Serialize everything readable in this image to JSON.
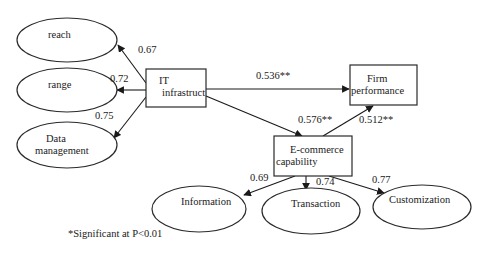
{
  "diagram": {
    "type": "structural-equation-model",
    "nodes": {
      "reach": {
        "label": "reach",
        "shape": "ellipse"
      },
      "range": {
        "label": "range",
        "shape": "ellipse"
      },
      "data_management": {
        "label_line1": "Data",
        "label_line2": "management",
        "shape": "ellipse"
      },
      "it_infrastructure": {
        "label_line1": "IT",
        "label_line2": "infrastruct",
        "shape": "rectangle"
      },
      "firm_performance": {
        "label_line1": "Firm",
        "label_line2": "performance",
        "shape": "rectangle"
      },
      "ecommerce_capability": {
        "label_line1": "E-commerce",
        "label_line2": "capability",
        "shape": "rectangle"
      },
      "information": {
        "label": "Information",
        "shape": "ellipse"
      },
      "transaction": {
        "label": "Transaction",
        "shape": "ellipse"
      },
      "customization": {
        "label": "Customization",
        "shape": "ellipse"
      }
    },
    "edges": [
      {
        "from": "it_infrastructure",
        "to": "reach",
        "weight": "0.67"
      },
      {
        "from": "it_infrastructure",
        "to": "range",
        "weight": "0.72"
      },
      {
        "from": "it_infrastructure",
        "to": "data_management",
        "weight": "0.75"
      },
      {
        "from": "it_infrastructure",
        "to": "firm_performance",
        "weight": "0.536**"
      },
      {
        "from": "it_infrastructure",
        "to": "ecommerce_capability",
        "weight": "0.576**"
      },
      {
        "from": "ecommerce_capability",
        "to": "firm_performance",
        "weight": "0.512**"
      },
      {
        "from": "ecommerce_capability",
        "to": "information",
        "weight": "0.69"
      },
      {
        "from": "ecommerce_capability",
        "to": "transaction",
        "weight": "0.74"
      },
      {
        "from": "ecommerce_capability",
        "to": "customization",
        "weight": "0.77"
      }
    ],
    "footnote": "*Significant at P<0.01"
  }
}
